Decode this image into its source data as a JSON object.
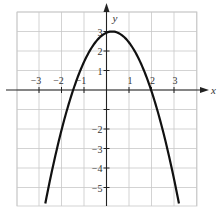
{
  "chart_data": {
    "type": "line",
    "title": "",
    "xlabel": "x",
    "ylabel": "y",
    "xlim": [
      -4,
      4
    ],
    "ylim": [
      -5.8,
      4
    ],
    "grid": true,
    "x_ticks": [
      -3,
      -2,
      -1,
      1,
      2,
      3
    ],
    "y_ticks": [
      -5,
      -4,
      -3,
      -2,
      -1,
      1,
      2,
      3
    ],
    "x_tick_labels": [
      "−3",
      "−2",
      "−1",
      "1",
      "2",
      "3"
    ],
    "y_tick_labels": [
      "−5",
      "−4",
      "−3",
      "−2",
      "",
      "1",
      "2",
      "3"
    ],
    "series": [
      {
        "name": "parabola",
        "description": "Downward-opening parabola, vertex near (0.25, 3), x-intercepts near -1.5 and 2",
        "equation_estimate": "y = 3 - (x - 0.25)^2",
        "points": [
          {
            "x": -2.7,
            "y": -5.7
          },
          {
            "x": -2.0,
            "y": -2.06
          },
          {
            "x": -1.5,
            "y": -0.06
          },
          {
            "x": -1.0,
            "y": 1.44
          },
          {
            "x": -0.5,
            "y": 2.44
          },
          {
            "x": 0.0,
            "y": 2.94
          },
          {
            "x": 0.25,
            "y": 3.0
          },
          {
            "x": 0.5,
            "y": 2.94
          },
          {
            "x": 1.0,
            "y": 2.44
          },
          {
            "x": 1.5,
            "y": 1.44
          },
          {
            "x": 2.0,
            "y": -0.06
          },
          {
            "x": 2.5,
            "y": -2.06
          },
          {
            "x": 3.2,
            "y": -5.7
          }
        ],
        "color": "#111111"
      }
    ]
  },
  "axes": {
    "x_label": "x",
    "y_label": "y"
  }
}
